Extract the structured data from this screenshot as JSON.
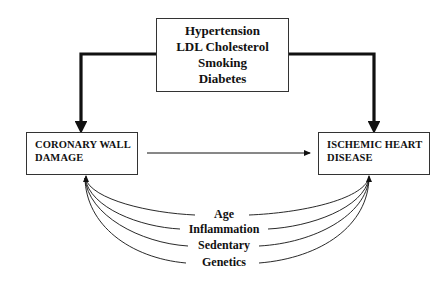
{
  "diagram": {
    "risk_factors_box": {
      "lines": [
        "Hypertension",
        "LDL Cholesterol",
        "Smoking",
        "Diabetes"
      ]
    },
    "left_node": {
      "lines": [
        "CORONARY WALL",
        "DAMAGE"
      ]
    },
    "right_node": {
      "lines": [
        "ISCHEMIC HEART",
        "DISEASE"
      ]
    },
    "other_factors": [
      "Age",
      "Inflammation",
      "Sedentary",
      "Genetics"
    ],
    "edges": [
      {
        "from": "risk_factors_box",
        "to": "left_node",
        "style": "thick"
      },
      {
        "from": "risk_factors_box",
        "to": "right_node",
        "style": "thick"
      },
      {
        "from": "left_node",
        "to": "right_node",
        "style": "thin"
      },
      {
        "from": "other_factors",
        "to": "left_node",
        "style": "thin-curved"
      },
      {
        "from": "other_factors",
        "to": "right_node",
        "style": "thin-curved"
      }
    ],
    "colors": {
      "line": "#111111",
      "background": "#ffffff",
      "box_border": "#333333"
    }
  }
}
